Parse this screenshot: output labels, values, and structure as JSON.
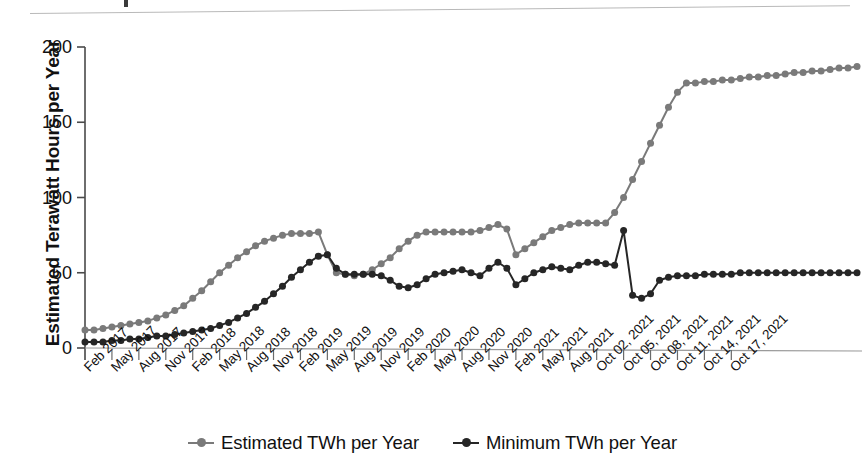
{
  "chart_data": {
    "type": "line",
    "title": "",
    "xlabel": "",
    "ylabel": "Estimated Terawatt Hours per Year",
    "ylim": [
      0,
      205
    ],
    "yticks": [
      0,
      50,
      100,
      150,
      200
    ],
    "grid": false,
    "legend_position": "bottom",
    "colors": {
      "estimated": "#7a7a7a",
      "minimum": "#262626",
      "axis": "#4a4a4a",
      "text": "#111111"
    },
    "x_tick_labels": [
      "Feb 2017",
      "May 2017",
      "Aug 2017",
      "Nov 2017",
      "Feb 2018",
      "May 2018",
      "Aug 2018",
      "Nov 2018",
      "Feb 2019",
      "May 2019",
      "Aug 2019",
      "Nov 2019",
      "Feb 2020",
      "May 2020",
      "Aug 2020",
      "Nov 2020",
      "Feb 2021",
      "May 2021",
      "Aug 2021",
      "Oct 02, 2021",
      "Oct 05, 2021",
      "Oct 08, 2021",
      "Oct 11, 2021",
      "Oct 14, 2021",
      "Oct 17, 2021"
    ],
    "x_tick_indices": [
      0,
      3,
      6,
      9,
      12,
      15,
      18,
      21,
      24,
      27,
      30,
      33,
      36,
      39,
      42,
      45,
      48,
      51,
      54,
      57,
      60,
      63,
      66,
      69,
      72
    ],
    "series": [
      {
        "name": "Estimated TWh per Year",
        "color": "#7a7a7a",
        "values": [
          12,
          12,
          13,
          14,
          15,
          16,
          17,
          18,
          20,
          22,
          25,
          28,
          33,
          38,
          44,
          50,
          55,
          60,
          64,
          68,
          71,
          73,
          75,
          76,
          76,
          76,
          77,
          62,
          50,
          49,
          48,
          49,
          52,
          56,
          60,
          66,
          71,
          75,
          77,
          77,
          77,
          77,
          77,
          77,
          78,
          80,
          82,
          79,
          62,
          66,
          70,
          74,
          78,
          80,
          82,
          83,
          83,
          83,
          83,
          90,
          100,
          112,
          124,
          136,
          148,
          160,
          170,
          176,
          176,
          177,
          177,
          178,
          178,
          179,
          180,
          180,
          181,
          181,
          182,
          183,
          183,
          184,
          184,
          185,
          186,
          186,
          187
        ]
      },
      {
        "name": "Minimum TWh per Year",
        "color": "#262626",
        "values": [
          4,
          4,
          4,
          5,
          5,
          6,
          6,
          7,
          8,
          8,
          9,
          10,
          11,
          12,
          13,
          15,
          17,
          20,
          23,
          27,
          31,
          36,
          41,
          47,
          52,
          57,
          61,
          62,
          53,
          49,
          49,
          49,
          49,
          48,
          45,
          41,
          40,
          42,
          46,
          49,
          50,
          51,
          52,
          50,
          48,
          53,
          57,
          53,
          42,
          46,
          50,
          52,
          54,
          53,
          52,
          55,
          57,
          57,
          56,
          55,
          78,
          35,
          33,
          36,
          45,
          47,
          48,
          48,
          48,
          49,
          49,
          49,
          49,
          50,
          50,
          50,
          50,
          50,
          50,
          50,
          50,
          50,
          50,
          50,
          50,
          50,
          50
        ]
      }
    ]
  },
  "legend": {
    "items": [
      {
        "label": "Estimated TWh per Year",
        "color": "#7a7a7a"
      },
      {
        "label": "Minimum TWh per Year",
        "color": "#262626"
      }
    ]
  },
  "axis": {
    "y_title": "Estimated Terawatt Hours per Year",
    "y_labels": [
      "200",
      "150",
      "100",
      "50",
      "0"
    ]
  }
}
